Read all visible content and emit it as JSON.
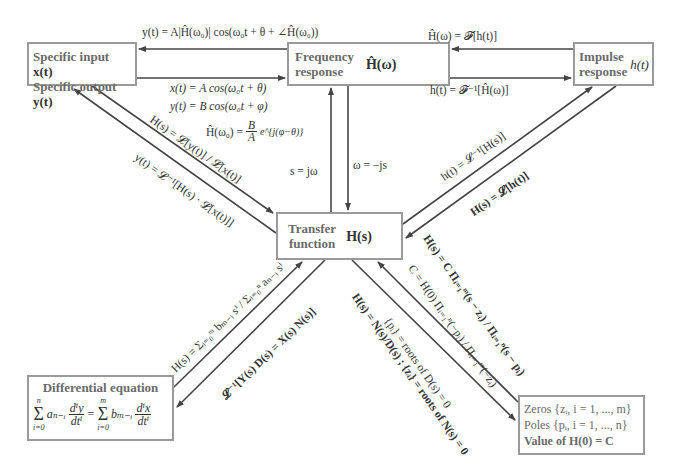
{
  "nodes": {
    "specific_io": {
      "line1": "Specific input ",
      "line1_math": "x(t)",
      "line2": "Specific output ",
      "line2_math": "y(t)"
    },
    "frequency_response": {
      "line1": "Frequency",
      "line2": "response",
      "symbol": "Ĥ(ω)"
    },
    "impulse_response": {
      "line1": "Impulse",
      "line2": "response",
      "symbol": "h(t)"
    },
    "transfer_function": {
      "line1": "Transfer",
      "line2": "function",
      "symbol": "H(s)"
    },
    "differential_equation": {
      "title": "Differential equation",
      "lhs_sum": "Σ",
      "lhs_top": "n",
      "lhs_bottom": "i=0",
      "lhs_term": "aₙ₋ᵢ",
      "lhs_frac_num": "dⁱy",
      "lhs_frac_den": "dtⁱ",
      "eq": "=",
      "rhs_sum": "Σ",
      "rhs_top": "m",
      "rhs_bottom": "i=0",
      "rhs_term": "bₘ₋ᵢ",
      "rhs_frac_num": "dⁱx",
      "rhs_frac_den": "dtⁱ"
    },
    "zeros_poles": {
      "line1": "Zeros {zᵢ, i = 1, ..., m}",
      "line2": "Poles {pᵢ, i = 1, ..., n}",
      "line3": "Value of H(0) = C"
    }
  },
  "edges": {
    "freq_to_specific": "y(t) = A|Ĥ(ω₀)| cos(ω₀t + θ + ∠Ĥ(ω₀))",
    "specific_to_freq_x": "x(t) = A cos(ω₀t + θ)",
    "specific_to_freq_y": "y(t) = B cos(ω₀t + φ)",
    "specific_to_freq_h": "Ĥ(ω₀) = ",
    "specific_to_freq_h_num": "B",
    "specific_to_freq_h_den": "A",
    "specific_to_freq_h_exp": "e^{j(φ−θ)}",
    "impulse_to_freq": "Ĥ(ω) = 𝓕[h(t)]",
    "freq_to_impulse": "h(t) = 𝓕⁻¹[Ĥ(ω)]",
    "transfer_to_freq": "s = jω",
    "freq_to_transfer": "ω = −js",
    "specific_to_transfer": "H(s) = 𝓛[y(t)] / 𝓛[x(t)]",
    "transfer_to_specific": "y(t) = 𝓛⁻¹[H(s) · 𝓛[x(t)]]",
    "transfer_to_impulse": "h(t) = 𝓛⁻¹[H(s)]",
    "impulse_to_transfer": "H(s) = 𝓛[h(t)]",
    "diffeq_to_transfer": "H(s) = Σᵢ₌₀ᵐ bₘ₋ᵢ sⁱ / Σᵢ₌₀ⁿ aₙ₋ᵢ sⁱ",
    "transfer_to_diffeq": "𝓛⁻¹[Y(s) D(s) = X(s) N(s)]",
    "zeros_to_transfer_1": "H(s) = C Πᵢ₌₁ᵐ(s − zᵢ) / Πᵢ₌₁ⁿ(s − pᵢ)",
    "zeros_to_transfer_2": "C = H(0) Πᵢ₌₁ⁿ(−pᵢ) / Πᵢ₌₁ᵐ(−zᵢ)",
    "transfer_to_zeros_1": "H(s) = N(s)/D(s) ; {zᵢ} = roots of N(s) = 0",
    "transfer_to_zeros_2": "{pᵢ} = roots of D(s) = 0"
  },
  "colors": {
    "box_border": "#9a9a9a",
    "box_text": "#6a6a6a",
    "arrow": "#444444",
    "math_text": "#333333"
  }
}
